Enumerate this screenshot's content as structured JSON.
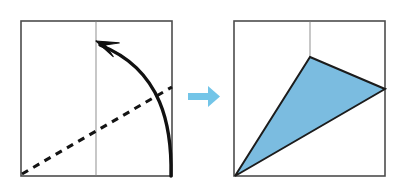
{
  "figure": {
    "type": "fold-sequence",
    "caption": "",
    "background_color": "#ffffff",
    "panels": [
      {
        "id": "before",
        "label": "before-fold",
        "square": {
          "x": 21,
          "y": 21,
          "width": 151,
          "height": 155,
          "stroke_color": "#4d4d4d",
          "stroke_width": 1.6,
          "fill_color": "#ffffff"
        },
        "center_line": {
          "label": "vertical-center-crease",
          "x": 96,
          "y1": 21,
          "y2": 176,
          "stroke_color": "#9a9a9a",
          "stroke_width": 1.1
        },
        "fold_line": {
          "label": "dashed-fold-line",
          "x1": 22,
          "y1": 174,
          "x2": 172,
          "y2": 87,
          "stroke_color": "#141414",
          "stroke_width": 3.1,
          "dash_pattern": "7 6"
        },
        "rotation_arrow": {
          "label": "curved-rotation-arrow",
          "start_x": 171,
          "start_y": 176,
          "control_x": 163,
          "control_y": 70,
          "end_x": 100,
          "end_y": 45,
          "tip_x": 96,
          "tip_y": 41,
          "stroke_color": "#111111",
          "stroke_width": 3.4,
          "head_length": 22,
          "head_width": 15
        }
      },
      {
        "id": "after",
        "label": "after-fold",
        "square": {
          "x": 234,
          "y": 21,
          "width": 151,
          "height": 155,
          "stroke_color": "#4d4d4d",
          "stroke_width": 1.6,
          "fill_color": "#ffffff"
        },
        "center_line": {
          "label": "vertical-center-crease",
          "x": 310,
          "y1": 21,
          "y2": 58,
          "stroke_color": "#9a9a9a",
          "stroke_width": 1.1
        },
        "folded_triangle": {
          "label": "folded-blue-triangle",
          "points": "310,57 385,89 235,176",
          "fill_color": "#7BBCE0",
          "stroke_color": "#1c1c1c",
          "stroke_width": 2.0,
          "vertices": [
            {
              "name": "apex",
              "x": 310,
              "y": 57
            },
            {
              "name": "right",
              "x": 385,
              "y": 89
            },
            {
              "name": "bottom-left",
              "x": 235,
              "y": 176
            }
          ]
        }
      }
    ],
    "transition_arrow": {
      "label": "step-transition-arrow",
      "color": "#73C5E8",
      "shaft_x": 188,
      "shaft_y": 93,
      "shaft_width": 22,
      "shaft_height": 7,
      "head_points": "208,86 220,96.5 208,107",
      "direction": "right"
    }
  }
}
